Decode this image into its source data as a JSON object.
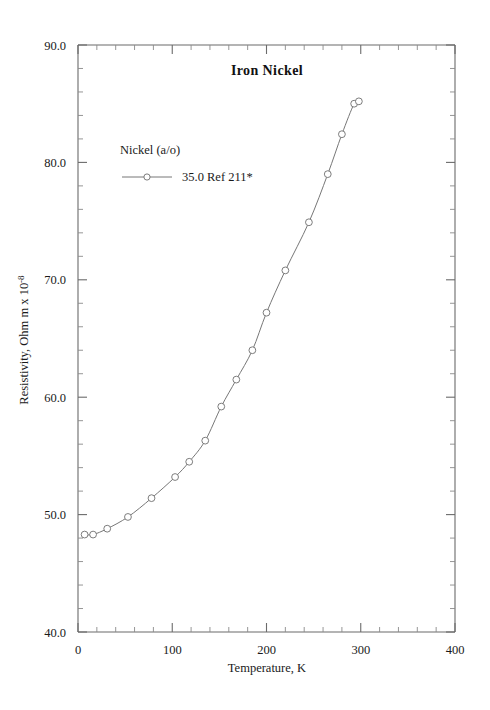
{
  "chart_data": {
    "type": "line",
    "title": "Iron  Nickel",
    "xlabel": "Temperature,  K",
    "ylabel": "Resistivity, Ohm m x 10",
    "ylabel_superscript": "-8",
    "xlim": [
      0,
      400
    ],
    "ylim": [
      40.0,
      90.0
    ],
    "x_major_ticks": [
      0,
      100,
      200,
      300,
      400
    ],
    "x_major_tick_labels": [
      "0",
      "100",
      "200",
      "300",
      "400"
    ],
    "x_minor_interval": 20,
    "y_major_ticks": [
      40.0,
      50.0,
      60.0,
      70.0,
      80.0,
      90.0
    ],
    "y_major_tick_labels": [
      "40.0",
      "50.0",
      "60.0",
      "70.0",
      "80.0",
      "90.0"
    ],
    "y_minor_interval": 2,
    "grid": false,
    "legend_position": "upper-left-inside",
    "legend_header": "Nickel (a/o)",
    "series": [
      {
        "name": "35.0 Ref 211*",
        "marker": "open-circle",
        "x": [
          7,
          16,
          31,
          53,
          78,
          103,
          118,
          135,
          152,
          168,
          185,
          200,
          220,
          245,
          265,
          280,
          293,
          298
        ],
        "values": [
          48.3,
          48.3,
          48.8,
          49.8,
          51.4,
          53.2,
          54.5,
          56.3,
          59.2,
          61.5,
          64.0,
          67.2,
          70.8,
          74.9,
          79.0,
          82.4,
          85.0,
          85.2
        ]
      }
    ]
  },
  "colors": {
    "background": "#ffffff",
    "axis": "#6b6b6b",
    "series": "#777777",
    "text": "#1a1a1a"
  }
}
